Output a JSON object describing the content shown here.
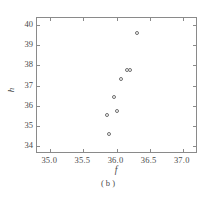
{
  "chart_data": {
    "type": "scatter",
    "title": "",
    "caption": "( b )",
    "xlabel": "f",
    "ylabel": "h",
    "xlim": [
      34.8,
      37.2
    ],
    "ylim": [
      33.7,
      40.35
    ],
    "xticks": [
      35.0,
      35.5,
      36.0,
      36.5,
      37.0
    ],
    "xticklabels": [
      "35.0",
      "35.5",
      "36.0",
      "36.5",
      "37.0"
    ],
    "yticks": [
      34,
      35,
      36,
      37,
      38,
      39,
      40
    ],
    "yticklabels": [
      "34",
      "35",
      "36",
      "37",
      "38",
      "39",
      "40"
    ],
    "grid": false,
    "legend": null,
    "marker": "open-circle",
    "marker_color": "#6e6e6e",
    "frame_color": "#8a8a8a",
    "background": "#ffffff",
    "points": [
      {
        "x": 35.88,
        "y": 34.6
      },
      {
        "x": 35.85,
        "y": 35.55
      },
      {
        "x": 36.0,
        "y": 35.72
      },
      {
        "x": 35.96,
        "y": 36.45
      },
      {
        "x": 36.07,
        "y": 37.3
      },
      {
        "x": 36.16,
        "y": 37.75
      },
      {
        "x": 36.21,
        "y": 37.75
      },
      {
        "x": 36.31,
        "y": 39.6
      }
    ]
  }
}
